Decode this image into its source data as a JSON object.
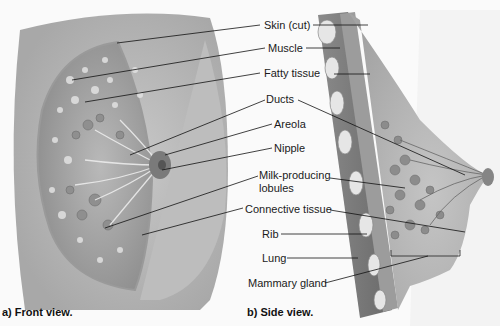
{
  "figure": {
    "colors": {
      "background": "#fafafa",
      "tissue_light": "#d8d8d8",
      "tissue_mid": "#b0b0b0",
      "tissue_dark": "#7a7a7a",
      "leader_line": "#111111"
    },
    "labels": [
      {
        "id": "skin",
        "text": "Skin (cut)"
      },
      {
        "id": "muscle",
        "text": "Muscle"
      },
      {
        "id": "fatty",
        "text": "Fatty tissue"
      },
      {
        "id": "ducts",
        "text": "Ducts"
      },
      {
        "id": "areola",
        "text": "Areola"
      },
      {
        "id": "nipple",
        "text": "Nipple"
      },
      {
        "id": "milk1",
        "text": "Milk-producing"
      },
      {
        "id": "milk2",
        "text": "lobules"
      },
      {
        "id": "connective",
        "text": "Connective tissue"
      },
      {
        "id": "rib",
        "text": "Rib"
      },
      {
        "id": "lung",
        "text": "Lung"
      },
      {
        "id": "mammary",
        "text": "Mammary gland"
      }
    ],
    "captions": {
      "front": "a) Front view.",
      "side": "b) Side view."
    }
  }
}
